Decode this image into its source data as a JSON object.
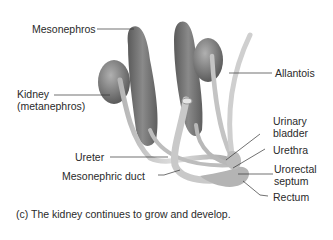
{
  "figure": {
    "labels": {
      "mesonephros": "Mesonephros",
      "kidney_line1": "Kidney",
      "kidney_line2": "(metanephros)",
      "allantois": "Allantois",
      "urinary_bladder_line1": "Urinary",
      "urinary_bladder_line2": "bladder",
      "urethra": "Urethra",
      "urorectal_line1": "Urorectal",
      "urorectal_line2": "septum",
      "rectum": "Rectum",
      "ureter": "Ureter",
      "mesonephric_duct": "Mesonephric duct"
    },
    "caption": "(c) The kidney continues to grow and develop."
  },
  "colors": {
    "background": "#ffffff",
    "organ_dark": "#6e6e6e",
    "organ_mid": "#9a9a9a",
    "duct_light": "#c8c8c8",
    "leader_line": "#333333"
  }
}
